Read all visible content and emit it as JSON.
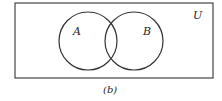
{
  "diagram": {
    "type": "venn",
    "caption": "(b)",
    "universe": {
      "label": "U",
      "x": 15,
      "y": 3,
      "width": 198,
      "height": 75
    },
    "sets": [
      {
        "label": "A",
        "cx": 88,
        "cy": 41,
        "r": 29,
        "label_x": 77,
        "label_y": 34
      },
      {
        "label": "B",
        "cx": 134,
        "cy": 41,
        "r": 29,
        "label_x": 146,
        "label_y": 34
      }
    ],
    "colors": {
      "stroke": "#333333",
      "background": "#ffffff",
      "text": "#1e1e1e"
    }
  }
}
